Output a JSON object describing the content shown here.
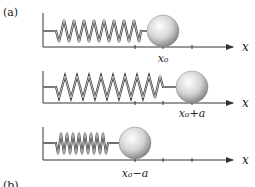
{
  "figure": {
    "panel_label_a": "(a)",
    "panel_label_b": "(b)",
    "axis_label": "x",
    "colors": {
      "line": "#333333",
      "ball_light": "#ffffff",
      "ball_dark": "#8a8a8a"
    },
    "rows": [
      {
        "state": "equilibrium",
        "ball_label": "x₀",
        "ball_position": "x0"
      },
      {
        "state": "stretched",
        "ball_label": "x₀+a",
        "ball_position": "x0+a"
      },
      {
        "state": "compressed",
        "ball_label": "x₀−a",
        "ball_position": "x0-a"
      }
    ]
  }
}
